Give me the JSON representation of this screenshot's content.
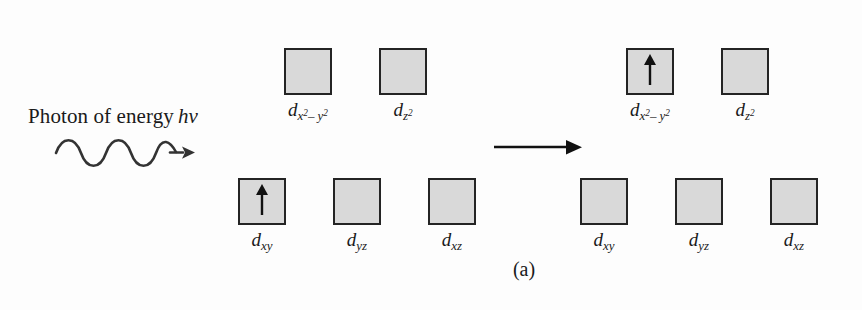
{
  "figure": {
    "caption": "(a)",
    "photon": {
      "text": "Photon of energy",
      "symbol": "hν",
      "wave_icon": "photon-wave-icon",
      "arrow_icon": "transition-arrow-icon"
    },
    "colors": {
      "box_fill": "#d9d9d9",
      "box_border": "#242424",
      "ink": "#1a1a1a",
      "background": "#fdfdfd"
    },
    "spin_icon": "spin-up-arrow-icon",
    "groups": [
      {
        "id": "left-upper",
        "side": "left",
        "level": "upper",
        "orbitals": [
          {
            "name": "d-x2-y2",
            "base": "d",
            "sub": "x",
            "sup1": "2",
            "mid": "– ",
            "sub2": "y",
            "sup2": "2",
            "occupied": false
          },
          {
            "name": "d-z2",
            "base": "d",
            "sub": "z",
            "sup1": "2",
            "mid": "",
            "sub2": "",
            "sup2": "",
            "occupied": false
          }
        ]
      },
      {
        "id": "left-lower",
        "side": "left",
        "level": "lower",
        "orbitals": [
          {
            "name": "d-xy",
            "base": "d",
            "sub": "xy",
            "sup1": "",
            "mid": "",
            "sub2": "",
            "sup2": "",
            "occupied": true
          },
          {
            "name": "d-yz",
            "base": "d",
            "sub": "yz",
            "sup1": "",
            "mid": "",
            "sub2": "",
            "sup2": "",
            "occupied": false
          },
          {
            "name": "d-xz",
            "base": "d",
            "sub": "xz",
            "sup1": "",
            "mid": "",
            "sub2": "",
            "sup2": "",
            "occupied": false
          }
        ]
      },
      {
        "id": "right-upper",
        "side": "right",
        "level": "upper",
        "orbitals": [
          {
            "name": "d-x2-y2",
            "base": "d",
            "sub": "x",
            "sup1": "2",
            "mid": "– ",
            "sub2": "y",
            "sup2": "2",
            "occupied": true
          },
          {
            "name": "d-z2",
            "base": "d",
            "sub": "z",
            "sup1": "2",
            "mid": "",
            "sub2": "",
            "sup2": "",
            "occupied": false
          }
        ]
      },
      {
        "id": "right-lower",
        "side": "right",
        "level": "lower",
        "orbitals": [
          {
            "name": "d-xy",
            "base": "d",
            "sub": "xy",
            "sup1": "",
            "mid": "",
            "sub2": "",
            "sup2": "",
            "occupied": false
          },
          {
            "name": "d-yz",
            "base": "d",
            "sub": "yz",
            "sup1": "",
            "mid": "",
            "sub2": "",
            "sup2": "",
            "occupied": false
          },
          {
            "name": "d-xz",
            "base": "d",
            "sub": "xz",
            "sup1": "",
            "mid": "",
            "sub2": "",
            "sup2": "",
            "occupied": false
          }
        ]
      }
    ]
  }
}
